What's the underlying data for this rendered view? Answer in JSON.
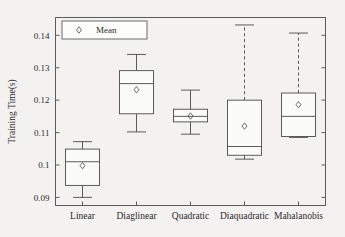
{
  "chart_data": {
    "type": "box",
    "title": "",
    "xlabel": "",
    "ylabel": "Training Time(s)",
    "categories": [
      "Linear",
      "Diaglinear",
      "Quadratic",
      "Diaquadratic",
      "Mahalanobis"
    ],
    "ylim": [
      0.0875,
      0.1455
    ],
    "yticks": [
      0.09,
      0.1,
      0.11,
      0.12,
      0.13,
      0.14
    ],
    "ytick_labels": [
      "0.09",
      "0.1",
      "0.11",
      "0.12",
      "0.13",
      "0.14"
    ],
    "grid": false,
    "legend": {
      "position": "top-left-inside",
      "entries": [
        {
          "label": "Mean",
          "marker": "diamond"
        }
      ]
    },
    "boxes": [
      {
        "category": "Linear",
        "whisker_low": 0.09,
        "q1": 0.0937,
        "median": 0.101,
        "mean": 0.0998,
        "q3": 0.1049,
        "whisker_high": 0.1072,
        "whisker_style": "solid"
      },
      {
        "category": "Diaglinear",
        "whisker_low": 0.1102,
        "q1": 0.1158,
        "median": 0.1251,
        "mean": 0.1232,
        "q3": 0.1291,
        "whisker_high": 0.1341,
        "whisker_style": "solid"
      },
      {
        "category": "Quadratic",
        "whisker_low": 0.1095,
        "q1": 0.1133,
        "median": 0.115,
        "mean": 0.1151,
        "q3": 0.1172,
        "whisker_high": 0.1231,
        "whisker_style": "solid"
      },
      {
        "category": "Diaquadratic",
        "whisker_low": 0.1018,
        "q1": 0.103,
        "median": 0.1057,
        "mean": 0.112,
        "q3": 0.12,
        "whisker_high": 0.1432,
        "whisker_style": "dashed"
      },
      {
        "category": "Mahalanobis",
        "whisker_low": 0.1085,
        "q1": 0.1088,
        "median": 0.115,
        "mean": 0.1186,
        "q3": 0.1222,
        "whisker_high": 0.1407,
        "whisker_style": "dashed"
      }
    ]
  },
  "colors": {
    "background": "#f3f2f0",
    "axis": "#5b5b5b",
    "box_stroke": "#4a4a4a",
    "box_fill": "#fbfbfa",
    "text": "#2b2b2b"
  }
}
